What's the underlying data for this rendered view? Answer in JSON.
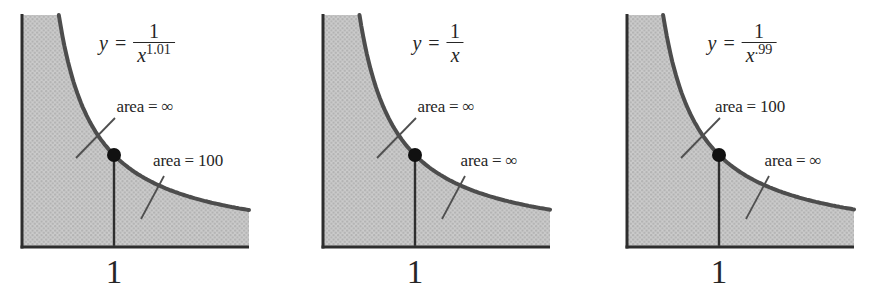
{
  "figure": {
    "background": "#ffffff",
    "colors": {
      "shade_fill": "#cbcbcb",
      "shade_dot": "#b0b0b0",
      "curve": "#4d4d4d",
      "axis": "#2e2e2e",
      "marker": "#111111",
      "leader": "#4f4f4f",
      "text": "#262626"
    },
    "panels": [
      {
        "equation": {
          "lhs": "y",
          "rel": "=",
          "numerator": "1",
          "base": "x",
          "exponent": "1.01"
        },
        "upper_area_label": "area = ∞",
        "lower_area_label": "area = 100",
        "x_tick": "1"
      },
      {
        "equation": {
          "lhs": "y",
          "rel": "=",
          "numerator": "1",
          "base": "x",
          "exponent": ""
        },
        "upper_area_label": "area = ∞",
        "lower_area_label": "area = ∞",
        "x_tick": "1"
      },
      {
        "equation": {
          "lhs": "y",
          "rel": "=",
          "numerator": "1",
          "base": "x",
          "exponent": ".99"
        },
        "upper_area_label": "area = 100",
        "lower_area_label": "area = ∞",
        "x_tick": "1"
      }
    ]
  },
  "chart_data": [
    {
      "type": "area",
      "title": "y = 1/x^1.01",
      "function": "y = 1/x^1.01",
      "exponent": 1.01,
      "x_range_shown": [
        0,
        2.47
      ],
      "y_range_shown": [
        0,
        2.52
      ],
      "grid": false,
      "marked_point": {
        "x": 1,
        "y": 1
      },
      "x_tick_labels": [
        "1"
      ],
      "y_tick_labels": [],
      "regions": [
        {
          "label": "area = ∞",
          "interval": "area under curve, 0 < x ≤ 1",
          "value": "∞"
        },
        {
          "label": "area = 100",
          "interval": "area under curve, x ≥ 1",
          "value": 100
        }
      ]
    },
    {
      "type": "area",
      "title": "y = 1/x",
      "function": "y = 1/x",
      "exponent": 1,
      "x_range_shown": [
        0,
        2.47
      ],
      "y_range_shown": [
        0,
        2.52
      ],
      "grid": false,
      "marked_point": {
        "x": 1,
        "y": 1
      },
      "x_tick_labels": [
        "1"
      ],
      "y_tick_labels": [],
      "regions": [
        {
          "label": "area = ∞",
          "interval": "area under curve, 0 < x ≤ 1",
          "value": "∞"
        },
        {
          "label": "area = ∞",
          "interval": "area under curve, x ≥ 1",
          "value": "∞"
        }
      ]
    },
    {
      "type": "area",
      "title": "y = 1/x^.99",
      "function": "y = 1/x^.99",
      "exponent": 0.99,
      "x_range_shown": [
        0,
        2.47
      ],
      "y_range_shown": [
        0,
        2.52
      ],
      "grid": false,
      "marked_point": {
        "x": 1,
        "y": 1
      },
      "x_tick_labels": [
        "1"
      ],
      "y_tick_labels": [],
      "regions": [
        {
          "label": "area = 100",
          "interval": "area under curve, 0 < x ≤ 1",
          "value": 100
        },
        {
          "label": "area = ∞",
          "interval": "area under curve, x ≥ 1",
          "value": "∞"
        }
      ]
    }
  ]
}
